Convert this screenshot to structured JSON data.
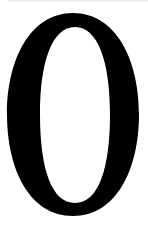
{
  "glyph": {
    "character": "0",
    "color": "#000000",
    "background": "#ffffff"
  },
  "strip_color": "#f1f1f1"
}
